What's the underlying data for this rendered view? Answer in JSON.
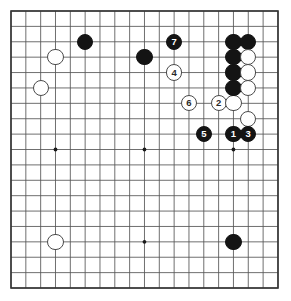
{
  "diagram": {
    "type": "go-board-diagram",
    "board_size": 19,
    "title": "",
    "caption": "",
    "colors": {
      "board_background": "#ffffff",
      "grid_line": "#555555",
      "border_line": "#333333",
      "black_stone": "#141414",
      "white_stone_fill": "#ffffff",
      "white_stone_edge": "#4a4a4a",
      "black_label_text": "#ffffff",
      "white_label_text": "#2a2a2a",
      "star_point": "#1a1a1a"
    },
    "geometry": {
      "left": 11,
      "top": 11,
      "right": 278,
      "bottom": 288,
      "cell_x": 14.83,
      "cell_y": 15.39,
      "stone_radius": 8.1
    },
    "star_points": [
      {
        "col": 4,
        "row": 4
      },
      {
        "col": 10,
        "row": 4
      },
      {
        "col": 16,
        "row": 4
      },
      {
        "col": 4,
        "row": 10
      },
      {
        "col": 10,
        "row": 10
      },
      {
        "col": 16,
        "row": 10
      },
      {
        "col": 4,
        "row": 16
      },
      {
        "col": 10,
        "row": 16
      },
      {
        "col": 16,
        "row": 16
      }
    ],
    "stones": [
      {
        "id": "b-d16",
        "color": "black",
        "col": 6,
        "row": 3,
        "label": ""
      },
      {
        "id": "w-c15",
        "color": "white",
        "col": 4,
        "row": 4,
        "label": ""
      },
      {
        "id": "w-b13",
        "color": "white",
        "col": 3,
        "row": 6,
        "label": ""
      },
      {
        "id": "b-j16",
        "color": "black",
        "col": 10,
        "row": 4,
        "label": ""
      },
      {
        "id": "b-7",
        "color": "black",
        "col": 12,
        "row": 3,
        "label": "7"
      },
      {
        "id": "w-4",
        "color": "white",
        "col": 12,
        "row": 5,
        "label": "4"
      },
      {
        "id": "w-6",
        "color": "white",
        "col": 13,
        "row": 7,
        "label": "6"
      },
      {
        "id": "w-2",
        "color": "white",
        "col": 15,
        "row": 7,
        "label": "2"
      },
      {
        "id": "w-p13",
        "color": "white",
        "col": 16,
        "row": 7,
        "label": ""
      },
      {
        "id": "b-p17",
        "color": "black",
        "col": 16,
        "row": 3,
        "label": ""
      },
      {
        "id": "b-q17",
        "color": "black",
        "col": 17,
        "row": 3,
        "label": ""
      },
      {
        "id": "b-p16",
        "color": "black",
        "col": 16,
        "row": 4,
        "label": ""
      },
      {
        "id": "w-q16",
        "color": "white",
        "col": 17,
        "row": 4,
        "label": ""
      },
      {
        "id": "b-p15",
        "color": "black",
        "col": 16,
        "row": 5,
        "label": ""
      },
      {
        "id": "w-q15",
        "color": "white",
        "col": 17,
        "row": 5,
        "label": ""
      },
      {
        "id": "b-p14",
        "color": "black",
        "col": 16,
        "row": 6,
        "label": ""
      },
      {
        "id": "w-q14",
        "color": "white",
        "col": 17,
        "row": 6,
        "label": ""
      },
      {
        "id": "w-q12",
        "color": "white",
        "col": 17,
        "row": 8,
        "label": ""
      },
      {
        "id": "b-5",
        "color": "black",
        "col": 14,
        "row": 9,
        "label": "5"
      },
      {
        "id": "b-1",
        "color": "black",
        "col": 16,
        "row": 9,
        "label": "1"
      },
      {
        "id": "b-3",
        "color": "black",
        "col": 17,
        "row": 9,
        "label": "3"
      },
      {
        "id": "w-d4",
        "color": "white",
        "col": 4,
        "row": 16,
        "label": ""
      },
      {
        "id": "b-q4",
        "color": "black",
        "col": 16,
        "row": 16,
        "label": ""
      }
    ],
    "move_sequence": [
      {
        "number": "1",
        "color": "black"
      },
      {
        "number": "2",
        "color": "white"
      },
      {
        "number": "3",
        "color": "black"
      },
      {
        "number": "4",
        "color": "white"
      },
      {
        "number": "5",
        "color": "black"
      },
      {
        "number": "6",
        "color": "white"
      },
      {
        "number": "7",
        "color": "black"
      }
    ]
  }
}
